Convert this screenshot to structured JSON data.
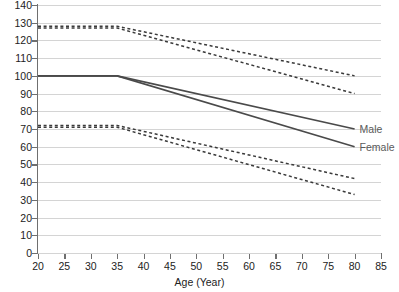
{
  "chart_data": {
    "type": "line",
    "title": "",
    "xlabel": "Age (Year)",
    "ylabel": "",
    "xlim": [
      20,
      85
    ],
    "ylim": [
      0,
      140
    ],
    "xticks": [
      20,
      25,
      30,
      35,
      40,
      45,
      50,
      55,
      60,
      65,
      70,
      75,
      80,
      85
    ],
    "yticks": [
      0,
      10,
      20,
      30,
      40,
      50,
      60,
      70,
      80,
      90,
      100,
      110,
      120,
      130,
      140
    ],
    "grid": "horizontal",
    "legend_position": "inline-right",
    "x": [
      20,
      35,
      80
    ],
    "series": [
      {
        "name": "Male upper band",
        "style": "dashed",
        "color": "#3a3a3a",
        "label": "",
        "values": [
          128,
          128,
          100
        ]
      },
      {
        "name": "Female upper band",
        "style": "dashed",
        "color": "#3a3a3a",
        "label": "",
        "values": [
          127,
          127,
          90
        ]
      },
      {
        "name": "Male",
        "style": "solid",
        "color": "#4a4a4a",
        "label": "Male",
        "values": [
          100,
          100,
          70
        ]
      },
      {
        "name": "Female",
        "style": "solid",
        "color": "#4a4a4a",
        "label": "Female",
        "values": [
          100,
          100,
          60
        ]
      },
      {
        "name": "Male lower band",
        "style": "dashed",
        "color": "#3a3a3a",
        "label": "",
        "values": [
          72,
          72,
          42
        ]
      },
      {
        "name": "Female lower band",
        "style": "dashed",
        "color": "#3a3a3a",
        "label": "",
        "values": [
          71,
          71,
          33
        ]
      }
    ]
  },
  "labels": {
    "male": "Male",
    "female": "Female"
  },
  "colors": {
    "axis": "#6f6f6f",
    "grid": "#d4d4d4",
    "solid_series": "#4a4a4a",
    "dashed_series": "#3a3a3a",
    "text": "#222222",
    "legend_text": "#5a5a5a",
    "background": "#ffffff"
  }
}
